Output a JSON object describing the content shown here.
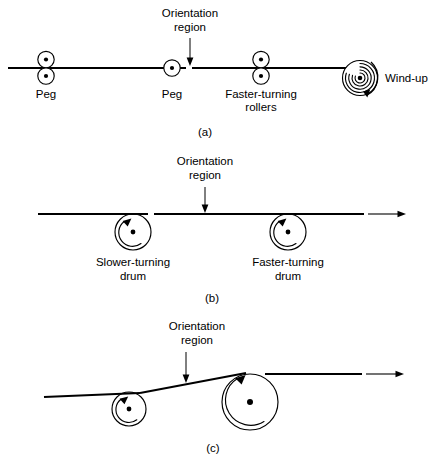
{
  "figure": {
    "panels": [
      {
        "id": "a",
        "caption": "(a)",
        "annotation": {
          "line1": "Orientation",
          "line2": "region"
        },
        "labels": [
          {
            "name": "peg-left",
            "text": "Peg"
          },
          {
            "name": "peg-middle",
            "text": "Peg"
          },
          {
            "name": "faster-rollers",
            "line1": "Faster-turning",
            "line2": "rollers"
          },
          {
            "name": "wind-up",
            "text": "Wind-up"
          }
        ]
      },
      {
        "id": "b",
        "caption": "(b)",
        "annotation": {
          "line1": "Orientation",
          "line2": "region"
        },
        "labels": [
          {
            "name": "slower-drum",
            "line1": "Slower-turning",
            "line2": "drum"
          },
          {
            "name": "faster-drum",
            "line1": "Faster-turning",
            "line2": "drum"
          }
        ]
      },
      {
        "id": "c",
        "caption": "(c)",
        "annotation": {
          "line1": "Orientation",
          "line2": "region"
        },
        "labels": []
      }
    ]
  },
  "colors": {
    "ink": "#000000",
    "paper": "#ffffff"
  }
}
